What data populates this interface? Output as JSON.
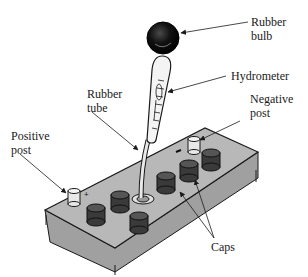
{
  "diagram": {
    "labels": {
      "rubber_bulb": [
        "Rubber",
        "bulb"
      ],
      "hydrometer": "Hydrometer",
      "rubber_tube": [
        "Rubber",
        "tube"
      ],
      "negative_post": [
        "Negative",
        "post"
      ],
      "positive_post": [
        "Positive",
        "post"
      ],
      "caps": "Caps"
    },
    "post_markings": {
      "positive": "+",
      "negative": "−"
    },
    "colors": {
      "background": "#ffffff",
      "battery_top": "#b3b3b3",
      "battery_side": "#a0a0a0",
      "cap": "#3a3a3a",
      "bulb": "#111111",
      "outline": "#1a1a1a"
    }
  }
}
